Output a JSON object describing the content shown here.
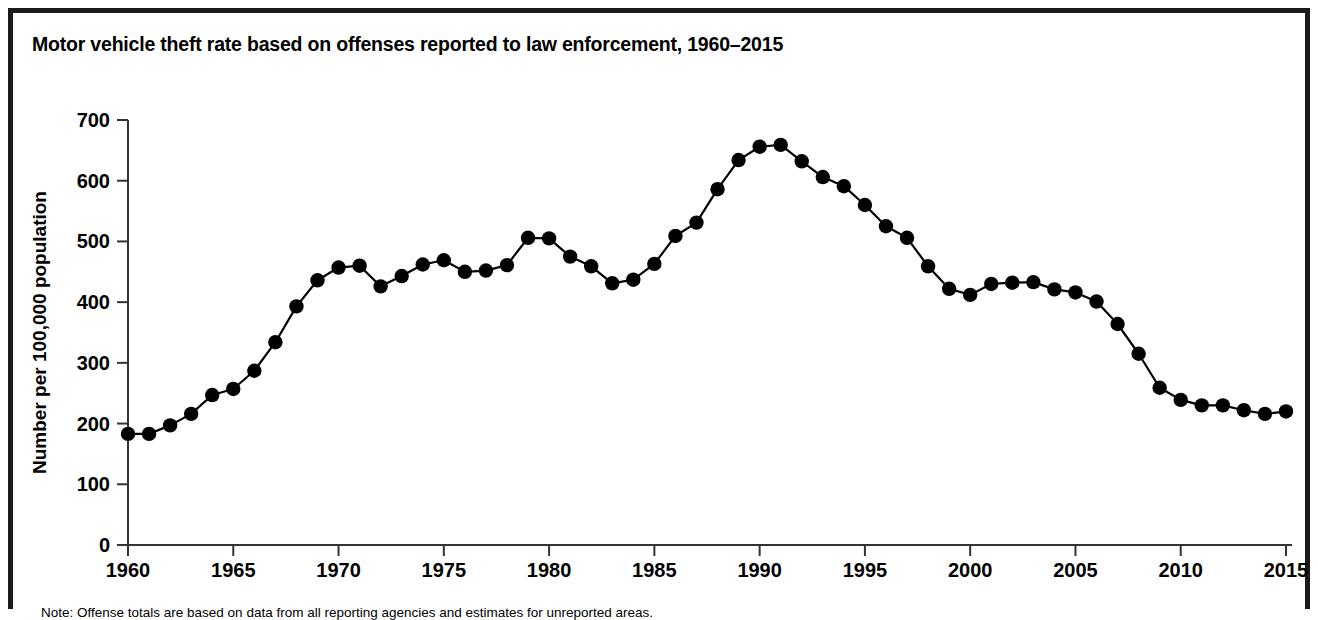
{
  "figure": {
    "title": "Motor vehicle theft rate based on offenses reported to law enforcement, 1960–2015",
    "note": "Note: Offense totals are based on data from all reporting agencies and estimates for unreported areas.",
    "frame_color": "#1a1a1a"
  },
  "chart_data": {
    "type": "line",
    "title": "Motor vehicle theft rate based on offenses reported to law enforcement, 1960–2015",
    "xlabel": "",
    "ylabel": "Number per 100,000 population",
    "xlim": [
      1960,
      2015
    ],
    "ylim": [
      0,
      700
    ],
    "yticks": [
      0,
      100,
      200,
      300,
      400,
      500,
      600,
      700
    ],
    "xticks": [
      1960,
      1965,
      1970,
      1975,
      1980,
      1985,
      1990,
      1995,
      2000,
      2005,
      2010,
      2015
    ],
    "grid": false,
    "legend": "none",
    "marker": "filled-circle",
    "line_color": "#000000",
    "marker_color": "#000000",
    "x": [
      1960,
      1961,
      1962,
      1963,
      1964,
      1965,
      1966,
      1967,
      1968,
      1969,
      1970,
      1971,
      1972,
      1973,
      1974,
      1975,
      1976,
      1977,
      1978,
      1979,
      1980,
      1981,
      1982,
      1983,
      1984,
      1985,
      1986,
      1987,
      1988,
      1989,
      1990,
      1991,
      1992,
      1993,
      1994,
      1995,
      1996,
      1997,
      1998,
      1999,
      2000,
      2001,
      2002,
      2003,
      2004,
      2005,
      2006,
      2007,
      2008,
      2009,
      2010,
      2011,
      2012,
      2013,
      2014,
      2015
    ],
    "values": [
      183,
      183,
      197,
      216,
      247,
      257,
      287,
      334,
      393,
      436,
      457,
      460,
      426,
      443,
      462,
      469,
      450,
      452,
      461,
      506,
      505,
      475,
      459,
      431,
      437,
      463,
      509,
      531,
      586,
      634,
      656,
      659,
      632,
      606,
      591,
      560,
      525,
      506,
      459,
      422,
      412,
      430,
      432,
      433,
      421,
      416,
      401,
      364,
      315,
      259,
      239,
      230,
      230,
      222,
      216,
      220
    ],
    "value_unit": "per 100,000 population"
  },
  "plot_geometry": {
    "left_px": 128,
    "right_px": 1286,
    "top_px": 120,
    "bottom_px": 545
  }
}
